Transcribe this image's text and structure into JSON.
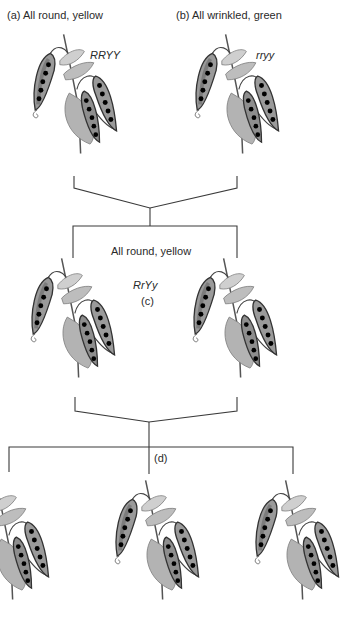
{
  "figure": {
    "type": "Mendel dihybrid cross diagram",
    "parents": [
      {
        "id": "a",
        "label": "(a) All round, yellow",
        "genotype": "RRYY",
        "pea_style": "round"
      },
      {
        "id": "b",
        "label": "(b) All wrinkled, green",
        "genotype": "rryy",
        "pea_style": "wrinkled"
      }
    ],
    "f1": {
      "phenotype_label": "All round, yellow",
      "genotype": "RrYy",
      "marker": "(c)",
      "plant_count": 2
    },
    "f2": {
      "marker": "(d)",
      "plant_count": 3
    },
    "colors": {
      "line": "#3a3a3a",
      "pod": "#8a8a8a",
      "pod_dark": "#3c3c3c",
      "leaf": "#b9b9b9",
      "pea_round": "#f2f2f2",
      "pea_wrinkled": "#6b6b6b"
    }
  }
}
